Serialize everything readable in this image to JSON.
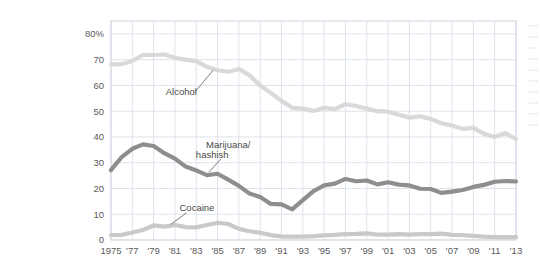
{
  "figure": {
    "title_lines": [
      "High school",
      "seniors",
      "reporting",
      "drug use"
    ],
    "y_axis_top_label": "80%"
  },
  "colors": {
    "alcohol": "#d9d9d9",
    "marijuana": "#8e8e8e",
    "cocaine": "#c9c9c9",
    "grid": "#dde3ec",
    "frame": "#cfd6e2",
    "text": "#3b3b3b",
    "tick_text": "#5a5a5a",
    "leader": "#6f6f6f",
    "background": "#ffffff"
  },
  "chart_data": {
    "type": "line",
    "title": "High school seniors reporting drug use",
    "xlabel": "",
    "ylabel": "",
    "ylim": [
      0,
      85
    ],
    "xlim": [
      1975,
      2013
    ],
    "grid": true,
    "legend": "inline-annotations",
    "ytick_labels": [
      "80%",
      "70",
      "60",
      "50",
      "40",
      "30",
      "20",
      "10",
      "0"
    ],
    "yticks": [
      80,
      70,
      60,
      50,
      40,
      30,
      20,
      10,
      0
    ],
    "xtick_labels": [
      "1975",
      "'77",
      "'79",
      "'81",
      "'83",
      "'85",
      "'87",
      "'89",
      "'91",
      "'93",
      "'95",
      "'97",
      "'99",
      "'01",
      "'03",
      "'05",
      "'07",
      "'09",
      "'11",
      "'13"
    ],
    "xticks": [
      1975,
      1977,
      1979,
      1981,
      1983,
      1985,
      1987,
      1989,
      1991,
      1993,
      1995,
      1997,
      1999,
      2001,
      2003,
      2005,
      2007,
      2009,
      2011,
      2013
    ],
    "x": [
      1975,
      1976,
      1977,
      1978,
      1979,
      1980,
      1981,
      1982,
      1983,
      1984,
      1985,
      1986,
      1987,
      1988,
      1989,
      1990,
      1991,
      1992,
      1993,
      1994,
      1995,
      1996,
      1997,
      1998,
      1999,
      2000,
      2001,
      2002,
      2003,
      2004,
      2005,
      2006,
      2007,
      2008,
      2009,
      2010,
      2011,
      2012,
      2013
    ],
    "series": [
      {
        "name": "Alcohol",
        "color": "#d9d9d9",
        "annotation": "Alcohol",
        "values": [
          68.2,
          68.3,
          69.5,
          71.8,
          71.8,
          72.0,
          70.7,
          70.0,
          69.4,
          67.2,
          65.9,
          65.3,
          66.4,
          63.9,
          60.0,
          57.1,
          54.0,
          51.3,
          51.0,
          50.1,
          51.3,
          50.8,
          52.7,
          52.0,
          51.0,
          50.0,
          49.8,
          48.6,
          47.5,
          48.0,
          47.0,
          45.3,
          44.4,
          43.1,
          43.5,
          41.2,
          40.0,
          41.5,
          39.2
        ]
      },
      {
        "name": "Marijuana/hashish",
        "color": "#8e8e8e",
        "annotation": "Marijuana/\nhashish",
        "values": [
          27.1,
          32.2,
          35.4,
          37.1,
          36.5,
          33.7,
          31.6,
          28.5,
          27.0,
          25.2,
          25.7,
          23.4,
          21.0,
          18.0,
          16.7,
          14.0,
          13.8,
          11.9,
          15.5,
          19.0,
          21.2,
          21.9,
          23.7,
          22.8,
          23.1,
          21.6,
          22.4,
          21.5,
          21.2,
          19.9,
          19.8,
          18.3,
          18.8,
          19.4,
          20.6,
          21.4,
          22.6,
          22.9,
          22.7
        ]
      },
      {
        "name": "Cocaine",
        "color": "#c9c9c9",
        "annotation": "Cocaine",
        "values": [
          1.9,
          2.0,
          2.9,
          3.9,
          5.7,
          5.2,
          5.8,
          5.0,
          4.9,
          5.8,
          6.7,
          6.2,
          4.3,
          3.4,
          2.8,
          1.9,
          1.4,
          1.3,
          1.3,
          1.5,
          1.8,
          2.0,
          2.3,
          2.4,
          2.6,
          2.1,
          2.1,
          2.3,
          2.1,
          2.3,
          2.3,
          2.5,
          2.0,
          1.9,
          1.6,
          1.3,
          1.1,
          1.1,
          1.1
        ]
      }
    ],
    "annotations": [
      {
        "text": "Alcohol",
        "x": 1981.6,
        "y": 58.0
      },
      {
        "text": "Marijuana/",
        "x": 1986.0,
        "y": 37.0
      },
      {
        "text": "hashish",
        "x": 1986.0,
        "y": 33.0
      },
      {
        "text": "Cocaine",
        "x": 1982.5,
        "y": 12.5
      }
    ]
  }
}
